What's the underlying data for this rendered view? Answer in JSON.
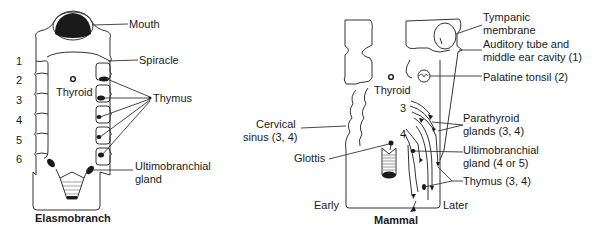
{
  "diagram": {
    "panels": [
      {
        "title": "Elasmobranch",
        "arch_numbers": [
          "1",
          "2",
          "3",
          "4",
          "5",
          "6"
        ],
        "labels": {
          "mouth": "Mouth",
          "spiracle": "Spiracle",
          "thyroid": "Thyroid",
          "thymus": "Thymus",
          "ultimobranchial_1": "Ultimobranchial",
          "ultimobranchial_2": "gland"
        }
      },
      {
        "title": "Mammal",
        "pouch_numbers": [
          "3",
          "4"
        ],
        "labels": {
          "tympanic_1": "Tympanic",
          "tympanic_2": "membrane",
          "auditory_1": "Auditory tube and",
          "auditory_2": "middle ear cavity (1)",
          "palatine": "Palatine tonsil (2)",
          "thyroid": "Thyroid",
          "cervical_1": "Cervical",
          "cervical_2": "sinus (3, 4)",
          "parathyroid_1": "Parathyroid",
          "parathyroid_2": "glands (3, 4)",
          "glottis": "Glottis",
          "ultimobranchial_1": "Ultimobranchial",
          "ultimobranchial_2": "gland (4 or 5)",
          "thymus": "Thymus (3, 4)",
          "early": "Early",
          "later": "Later"
        }
      }
    ]
  },
  "colors": {
    "line": "#333333",
    "fill_dark": "#1a1a1a",
    "background": "#ffffff"
  }
}
